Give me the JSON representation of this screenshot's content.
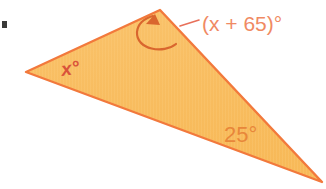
{
  "figure": {
    "kind": "geometry-diagram",
    "shape": "triangle",
    "background_color": "#ffffff",
    "canvas": {
      "width": 326,
      "height": 189
    }
  },
  "triangle": {
    "fill_color": "#F8BC5E",
    "fill_color_light": "#FBCE82",
    "stroke_color": "#F2793C",
    "stroke_width": 2.4,
    "vertices": [
      {
        "name": "left-vertex",
        "x": 26,
        "y": 72
      },
      {
        "name": "apex-vertex",
        "x": 160,
        "y": 10
      },
      {
        "name": "right-vertex",
        "x": 322,
        "y": 182
      }
    ],
    "points_path": "26,72 160,10 322,182"
  },
  "labels": {
    "angle_x": {
      "text": "x°",
      "variable": "x",
      "color": "#D9533A",
      "font_size": 19,
      "x": 62,
      "y": 76,
      "rotation": -8
    },
    "angle_x_plus_65": {
      "text": "(x + 65)°",
      "expression": "x + 65",
      "color": "#F08A63",
      "font_size": 21,
      "x": 202,
      "y": 31
    },
    "angle_25": {
      "text": "25°",
      "value": 25,
      "color": "#E8873A",
      "font_size": 22,
      "x": 224,
      "y": 142
    }
  },
  "annotations": {
    "leader_line": {
      "name": "leader-line",
      "color": "#E8705A",
      "stroke_width": 1.6,
      "path": "M 180 26 L 199 20"
    },
    "curved_arrow": {
      "name": "curved-arrow",
      "color": "#D9662E",
      "stroke_width": 2.2,
      "path": "M 176 44 C 164 54, 136 50, 137 32 C 138 22, 146 18, 153 16",
      "arrow_tip": {
        "x": 155,
        "y": 15
      },
      "arrow_head_points": "155,14 146,24 160,25",
      "points_to": "apex-vertex"
    },
    "page_mark": {
      "name": "page-mark",
      "color": "#3A3A38",
      "x": 2,
      "y": 21,
      "width": 5,
      "height": 7
    }
  }
}
